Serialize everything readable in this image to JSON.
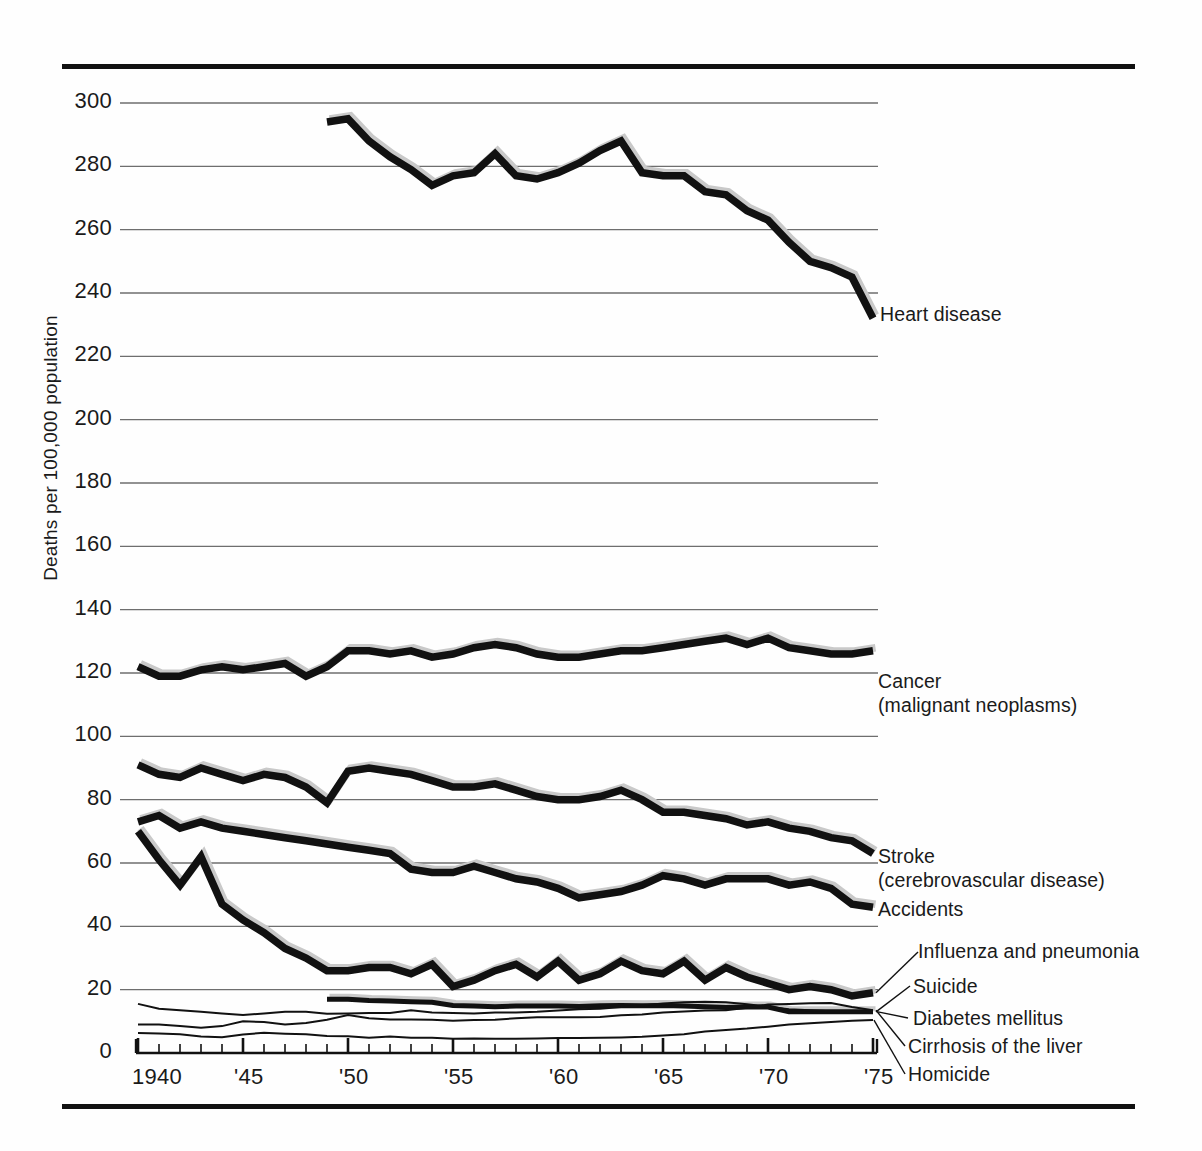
{
  "figure": {
    "ylabel": "Deaths per 100,000 population",
    "y_ticks": [
      "300",
      "280",
      "260",
      "240",
      "220",
      "200",
      "180",
      "160",
      "140",
      "120",
      "100",
      "80",
      "60",
      "40",
      "20",
      "0"
    ],
    "x_ticks": [
      "1940",
      "'45",
      "'50",
      "'55",
      "'60",
      "'65",
      "'70",
      "'75"
    ]
  },
  "series_labels": {
    "heart": "Heart disease",
    "cancer_1": "Cancer",
    "cancer_2": "(malignant neoplasms)",
    "stroke_1": "Stroke",
    "stroke_2": "(cerebrovascular disease)",
    "accidents": "Accidents",
    "influenza": "Influenza and pneumonia",
    "suicide": "Suicide",
    "diabetes": "Diabetes mellitus",
    "cirrhosis": "Cirrhosis of the liver",
    "homicide": "Homicide"
  },
  "chart_data": {
    "type": "line",
    "title": "",
    "xlabel": "",
    "ylabel": "Deaths per 100,000 population",
    "xlim": [
      1940,
      1975
    ],
    "ylim": [
      0,
      300
    ],
    "ytick_values": [
      0,
      20,
      40,
      60,
      80,
      100,
      120,
      140,
      160,
      180,
      200,
      220,
      240,
      260,
      280,
      300
    ],
    "xtick_values": [
      1940,
      1945,
      1950,
      1955,
      1960,
      1965,
      1970,
      1975
    ],
    "xtick_labels": [
      "1940",
      "'45",
      "'50",
      "'55",
      "'60",
      "'65",
      "'70",
      "'75"
    ],
    "grid": "horizontal",
    "legend": "right-side inline labels",
    "minor_xticks": "every year 1940-1975",
    "series": [
      {
        "name": "Heart disease",
        "style": "thick",
        "x": [
          1949,
          1950,
          1951,
          1952,
          1953,
          1954,
          1955,
          1956,
          1957,
          1958,
          1959,
          1960,
          1961,
          1962,
          1963,
          1964,
          1965,
          1966,
          1967,
          1968,
          1969,
          1970,
          1971,
          1972,
          1973,
          1974,
          1975
        ],
        "values": [
          294,
          295,
          288,
          283,
          279,
          274,
          277,
          278,
          284,
          277,
          276,
          278,
          281,
          285,
          288,
          278,
          277,
          277,
          272,
          271,
          266,
          263,
          256,
          250,
          248,
          245,
          232
        ]
      },
      {
        "name": "Cancer (malignant neoplasms)",
        "style": "thick",
        "x": [
          1940,
          1941,
          1942,
          1943,
          1944,
          1945,
          1946,
          1947,
          1948,
          1949,
          1950,
          1951,
          1952,
          1953,
          1954,
          1955,
          1956,
          1957,
          1958,
          1959,
          1960,
          1961,
          1962,
          1963,
          1964,
          1965,
          1966,
          1967,
          1968,
          1969,
          1970,
          1971,
          1972,
          1973,
          1974,
          1975
        ],
        "values": [
          122,
          119,
          119,
          121,
          122,
          121,
          122,
          123,
          119,
          122,
          127,
          127,
          126,
          127,
          125,
          126,
          128,
          129,
          128,
          126,
          125,
          125,
          126,
          127,
          127,
          128,
          129,
          130,
          131,
          129,
          131,
          128,
          127,
          126,
          126,
          127
        ]
      },
      {
        "name": "Stroke (cerebrovascular disease)",
        "style": "thick",
        "x": [
          1940,
          1941,
          1942,
          1943,
          1944,
          1945,
          1946,
          1947,
          1948,
          1949,
          1950,
          1951,
          1952,
          1953,
          1954,
          1955,
          1956,
          1957,
          1958,
          1959,
          1960,
          1961,
          1962,
          1963,
          1964,
          1965,
          1966,
          1967,
          1968,
          1969,
          1970,
          1971,
          1972,
          1973,
          1974,
          1975
        ],
        "values": [
          91,
          88,
          87,
          90,
          88,
          86,
          88,
          87,
          84,
          79,
          89,
          90,
          89,
          88,
          86,
          84,
          84,
          85,
          83,
          81,
          80,
          80,
          81,
          83,
          80,
          76,
          76,
          75,
          74,
          72,
          73,
          71,
          70,
          68,
          67,
          63
        ]
      },
      {
        "name": "Accidents",
        "style": "thick",
        "x": [
          1940,
          1941,
          1942,
          1943,
          1944,
          1945,
          1946,
          1947,
          1948,
          1949,
          1950,
          1951,
          1952,
          1953,
          1954,
          1955,
          1956,
          1957,
          1958,
          1959,
          1960,
          1961,
          1962,
          1963,
          1964,
          1965,
          1966,
          1967,
          1968,
          1969,
          1970,
          1971,
          1972,
          1973,
          1974,
          1975
        ],
        "values": [
          73,
          75,
          71,
          73,
          71,
          70,
          69,
          68,
          67,
          66,
          65,
          64,
          63,
          58,
          57,
          57,
          59,
          57,
          55,
          54,
          52,
          49,
          50,
          51,
          53,
          56,
          55,
          53,
          55,
          55,
          55,
          53,
          54,
          52,
          47,
          46
        ]
      },
      {
        "name": "Influenza and pneumonia",
        "style": "thick",
        "x": [
          1940,
          1941,
          1942,
          1943,
          1944,
          1945,
          1946,
          1947,
          1948,
          1949,
          1950,
          1951,
          1952,
          1953,
          1954,
          1955,
          1956,
          1957,
          1958,
          1959,
          1960,
          1961,
          1962,
          1963,
          1964,
          1965,
          1966,
          1967,
          1968,
          1969,
          1970,
          1971,
          1972,
          1973,
          1974,
          1975
        ],
        "values": [
          70,
          61,
          53,
          62,
          47,
          42,
          38,
          33,
          30,
          26,
          26,
          27,
          27,
          25,
          28,
          21,
          23,
          26,
          28,
          24,
          29,
          23,
          25,
          29,
          26,
          25,
          29,
          23,
          27,
          24,
          22,
          20,
          21,
          20,
          18,
          19
        ]
      },
      {
        "name": "Suicide",
        "style": "thick-short",
        "x": [
          1949,
          1950,
          1951,
          1952,
          1953,
          1954,
          1955,
          1956,
          1957,
          1958,
          1959,
          1960,
          1961,
          1962,
          1963,
          1964,
          1965,
          1966,
          1967,
          1968,
          1969,
          1970,
          1971,
          1972,
          1973,
          1974,
          1975
        ],
        "values": [
          17,
          17,
          16.6,
          16.4,
          16.2,
          16,
          15,
          14.8,
          14.6,
          14.8,
          14.8,
          14.8,
          14.7,
          14.9,
          15,
          14.9,
          15,
          14.8,
          14.6,
          14.4,
          14.5,
          14.5,
          13,
          13,
          13,
          13,
          13
        ]
      },
      {
        "name": "Diabetes mellitus",
        "style": "thin",
        "x": [
          1940,
          1941,
          1942,
          1943,
          1944,
          1945,
          1946,
          1947,
          1948,
          1949,
          1950,
          1951,
          1952,
          1953,
          1954,
          1955,
          1956,
          1957,
          1958,
          1959,
          1960,
          1961,
          1962,
          1963,
          1964,
          1965,
          1966,
          1967,
          1968,
          1969,
          1970,
          1971,
          1972,
          1973,
          1974,
          1975
        ],
        "values": [
          15.5,
          14,
          13.5,
          13,
          12.5,
          12,
          12.5,
          13,
          13,
          12.4,
          12.5,
          12.6,
          12.6,
          13.5,
          12.8,
          12.6,
          12.5,
          12.8,
          12.8,
          13,
          13.4,
          13.8,
          14,
          14.5,
          15,
          15.6,
          16,
          16.2,
          16,
          15.4,
          14.6,
          13.8,
          13.5,
          13.2,
          13,
          13
        ]
      },
      {
        "name": "Cirrhosis of the liver",
        "style": "thin",
        "x": [
          1940,
          1941,
          1942,
          1943,
          1944,
          1945,
          1946,
          1947,
          1948,
          1949,
          1950,
          1951,
          1952,
          1953,
          1954,
          1955,
          1956,
          1957,
          1958,
          1959,
          1960,
          1961,
          1962,
          1963,
          1964,
          1965,
          1966,
          1967,
          1968,
          1969,
          1970,
          1971,
          1972,
          1973,
          1974,
          1975
        ],
        "values": [
          9,
          9,
          8.5,
          8,
          8.5,
          10,
          9.8,
          9,
          9.5,
          10.5,
          12,
          11,
          10.6,
          10.6,
          10.5,
          10.2,
          10.4,
          10.5,
          11,
          11.3,
          11.3,
          11.3,
          11.4,
          11.9,
          12.2,
          12.8,
          13.1,
          13.4,
          13.5,
          14.3,
          15.3,
          15.5,
          15.7,
          15.8,
          14.5,
          13.5
        ]
      },
      {
        "name": "Homicide",
        "style": "thin",
        "x": [
          1940,
          1941,
          1942,
          1943,
          1944,
          1945,
          1946,
          1947,
          1948,
          1949,
          1950,
          1951,
          1952,
          1953,
          1954,
          1955,
          1956,
          1957,
          1958,
          1959,
          1960,
          1961,
          1962,
          1963,
          1964,
          1965,
          1966,
          1967,
          1968,
          1969,
          1970,
          1971,
          1972,
          1973,
          1974,
          1975
        ],
        "values": [
          6.3,
          6.2,
          5.9,
          5.2,
          5,
          5.8,
          6.4,
          6.1,
          5.9,
          5.4,
          5.3,
          4.8,
          5.2,
          4.8,
          4.8,
          4.5,
          4.6,
          4.5,
          4.5,
          4.6,
          4.7,
          4.7,
          4.8,
          4.9,
          5.1,
          5.5,
          5.9,
          6.8,
          7.3,
          7.7,
          8.3,
          9,
          9.4,
          9.8,
          10.2,
          10.4
        ]
      }
    ]
  }
}
